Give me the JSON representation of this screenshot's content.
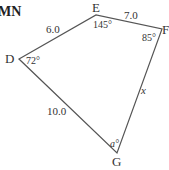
{
  "header_fragment": "MN",
  "diagram": {
    "type": "quadrilateral",
    "vertices": [
      "D",
      "E",
      "F",
      "G"
    ],
    "sides": [
      {
        "from": "D",
        "to": "E",
        "label": "6.0"
      },
      {
        "from": "E",
        "to": "F",
        "label": "7.0"
      },
      {
        "from": "F",
        "to": "G",
        "label": "x"
      },
      {
        "from": "G",
        "to": "D",
        "label": "10.0"
      }
    ],
    "angles": [
      {
        "vertex": "D",
        "label": "72°"
      },
      {
        "vertex": "E",
        "label": "145°"
      },
      {
        "vertex": "F",
        "label": "85°"
      },
      {
        "vertex": "G",
        "label": "a°"
      }
    ],
    "line_color": "#555555"
  }
}
